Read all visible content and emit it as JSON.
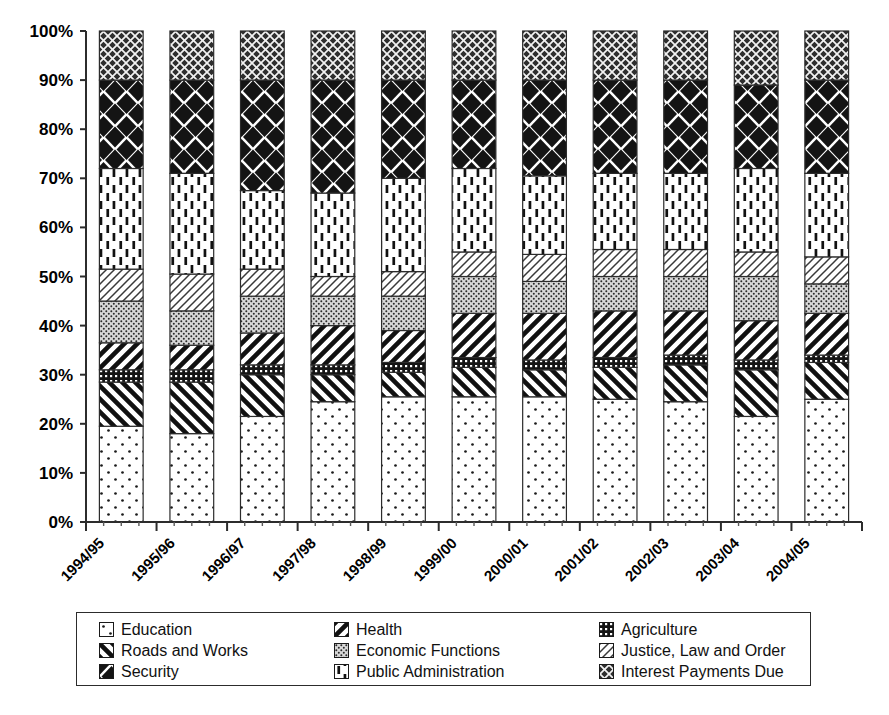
{
  "chart_data": {
    "type": "bar",
    "subtype": "stacked-percentage",
    "title": "",
    "xlabel": "",
    "ylabel": "",
    "ylim": [
      0,
      100
    ],
    "ytick_labels": [
      "0%",
      "10%",
      "20%",
      "30%",
      "40%",
      "50%",
      "60%",
      "70%",
      "80%",
      "90%",
      "100%"
    ],
    "ytick_values": [
      0,
      10,
      20,
      30,
      40,
      50,
      60,
      70,
      80,
      90,
      100
    ],
    "grid": false,
    "legend_position": "bottom",
    "categories": [
      "1994/95",
      "1995/96",
      "1996/97",
      "1997/98",
      "1998/99",
      "1999/00",
      "2000/01",
      "2001/02",
      "2002/03",
      "2003/04",
      "2004/05"
    ],
    "series": [
      {
        "name": "Education",
        "pattern": "sparse-dots",
        "values": [
          19.5,
          18.0,
          21.5,
          24.5,
          25.5,
          25.5,
          25.5,
          25.0,
          24.5,
          21.5,
          25.0
        ]
      },
      {
        "name": "Roads and Works",
        "pattern": "back-diagonal",
        "values": [
          9.0,
          10.5,
          8.5,
          5.5,
          5.0,
          6.0,
          5.5,
          6.5,
          7.5,
          9.5,
          7.5
        ]
      },
      {
        "name": "Agriculture",
        "pattern": "dense-dark-grid",
        "values": [
          2.5,
          2.5,
          2.0,
          2.0,
          2.0,
          2.0,
          2.0,
          2.0,
          2.0,
          2.0,
          1.5
        ]
      },
      {
        "name": "Health",
        "pattern": "fwd-diagonal",
        "values": [
          5.5,
          5.0,
          6.5,
          8.0,
          6.5,
          9.0,
          9.5,
          9.5,
          9.0,
          8.0,
          8.5
        ]
      },
      {
        "name": "Economic Functions",
        "pattern": "stipple",
        "values": [
          8.5,
          7.0,
          7.5,
          6.0,
          7.0,
          7.5,
          6.5,
          7.0,
          7.0,
          9.0,
          6.0
        ]
      },
      {
        "name": "Justice, Law and Order",
        "pattern": "light-hatch",
        "values": [
          6.5,
          7.5,
          5.5,
          4.0,
          5.0,
          5.0,
          5.5,
          5.5,
          5.5,
          5.0,
          5.5
        ]
      },
      {
        "name": "Public Administration",
        "pattern": "vertical-dashes",
        "values": [
          20.5,
          20.5,
          16.0,
          17.0,
          19.0,
          17.0,
          16.0,
          15.5,
          15.5,
          17.0,
          17.0
        ]
      },
      {
        "name": "Security",
        "pattern": "large-diamonds",
        "values": [
          18.0,
          19.0,
          22.5,
          23.0,
          20.0,
          18.0,
          19.5,
          19.0,
          19.0,
          17.0,
          19.0
        ]
      },
      {
        "name": "Interest Payments Due",
        "pattern": "dark-crosshatch",
        "values": [
          10.0,
          10.0,
          10.0,
          10.0,
          10.0,
          10.0,
          10.0,
          10.0,
          10.0,
          11.0,
          10.0
        ]
      }
    ]
  },
  "legend": {
    "items": [
      {
        "label": "Education",
        "pattern": "sparse-dots"
      },
      {
        "label": "Health",
        "pattern": "fwd-diagonal"
      },
      {
        "label": "Agriculture",
        "pattern": "dense-dark-grid"
      },
      {
        "label": "Roads and Works",
        "pattern": "back-diagonal"
      },
      {
        "label": "Economic Functions",
        "pattern": "stipple"
      },
      {
        "label": "Justice, Law and Order",
        "pattern": "light-hatch"
      },
      {
        "label": "Security",
        "pattern": "large-diamonds"
      },
      {
        "label": "Public Administration",
        "pattern": "vertical-dashes"
      },
      {
        "label": "Interest Payments Due",
        "pattern": "dark-crosshatch"
      }
    ]
  },
  "colors": {
    "ink": "#000000",
    "axis": "#2c2c2c",
    "background": "#ffffff"
  }
}
